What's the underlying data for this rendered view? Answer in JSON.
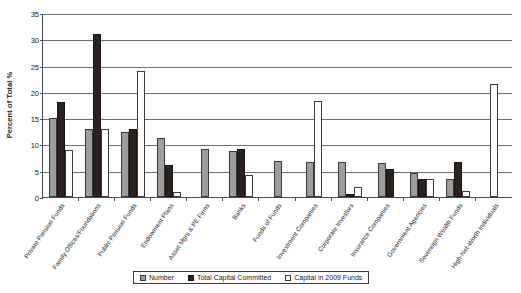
{
  "chart_data": {
    "type": "bar",
    "title": "",
    "xlabel": "",
    "ylabel": "Percent of Total %",
    "ylim": [
      0,
      35
    ],
    "yticks": [
      0,
      5,
      10,
      15,
      20,
      25,
      30,
      35
    ],
    "grid": true,
    "legend_position": "bottom",
    "categories": [
      "Private Pension Funds",
      "Family Offices/Foundations",
      "Public Pension Funds",
      "Endowment Plans",
      "Asset Mgrs & PE Firms",
      "Banks",
      "Funds of Funds",
      "Investment Companies",
      "Corporate Investors",
      "Insurance Companies",
      "Government Agencies",
      "Sovereign Wealth Funds",
      "High-Net-Worth Individuals"
    ],
    "series": [
      {
        "name": "Number",
        "color": "#9d9d9d",
        "values": [
          15.0,
          13.0,
          12.4,
          11.2,
          9.1,
          8.7,
          6.9,
          6.7,
          6.6,
          6.4,
          4.5,
          3.4,
          0.0
        ]
      },
      {
        "name": "Total Capital Committed",
        "color": "#2b2320",
        "values": [
          18.0,
          31.1,
          13.0,
          6.1,
          0.0,
          9.2,
          0.0,
          0.0,
          0.6,
          5.4,
          3.4,
          6.6,
          0.0
        ]
      },
      {
        "name": "Capital in 2009 Funds",
        "color": "#ffffff",
        "values": [
          9.0,
          13.0,
          24.0,
          1.0,
          0.0,
          4.2,
          0.0,
          18.3,
          2.0,
          0.0,
          3.5,
          1.1,
          21.5
        ]
      }
    ]
  },
  "legend": {
    "items": [
      {
        "label": "Number",
        "swatch": "series-number"
      },
      {
        "label": "Total Capital Committed",
        "swatch": "series-committed"
      },
      {
        "label": "Capital in 2009 Funds",
        "swatch": "series-2009"
      }
    ]
  }
}
